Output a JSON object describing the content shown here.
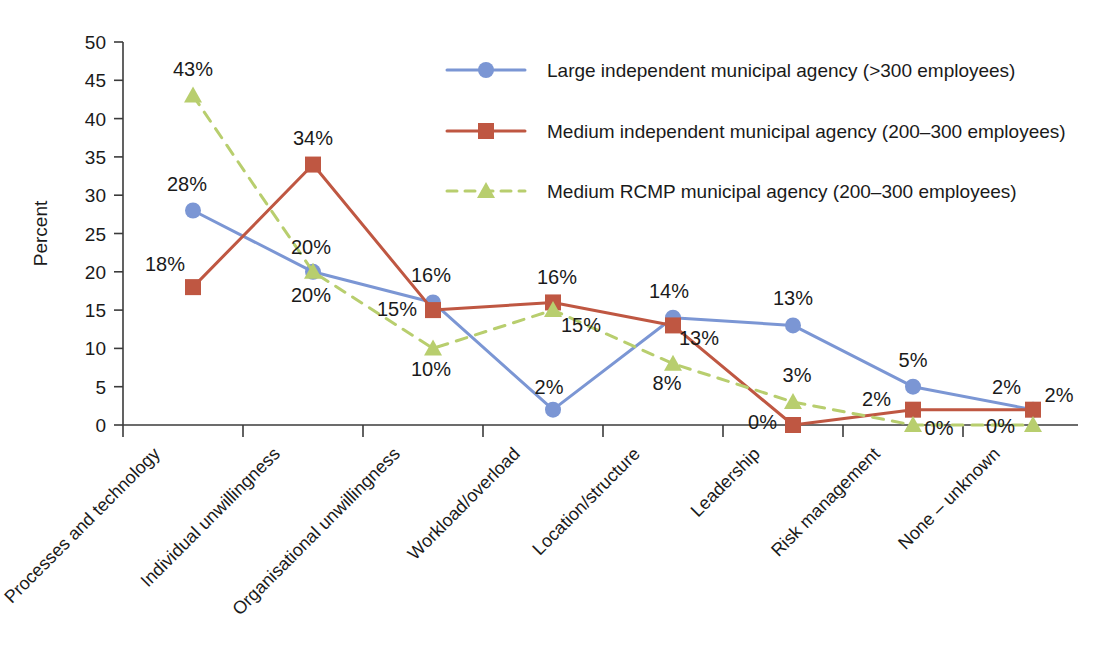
{
  "chart_data": {
    "type": "line",
    "title": "",
    "xlabel": "",
    "ylabel": "Percent",
    "ylim": [
      0,
      50
    ],
    "ytick_step": 5,
    "yticks": [
      "0",
      "5",
      "10",
      "15",
      "20",
      "25",
      "30",
      "35",
      "40",
      "45",
      "50"
    ],
    "grid": false,
    "legend_position": "top-right",
    "value_labels_suffix": "%",
    "categories": [
      "Processes and technology",
      "Individual unwillingness",
      "Organisational unwillingness",
      "Workload/overload",
      "Location/structure",
      "Leadership",
      "Risk management",
      "None – unknown"
    ],
    "series": [
      {
        "name": "Large independent municipal agency (>300 employees)",
        "color": "#7b96d4",
        "marker": "circle",
        "line_style": "solid",
        "values": [
          28,
          20,
          16,
          2,
          14,
          13,
          5,
          2
        ],
        "labels": [
          "28%",
          "20%",
          "16%",
          "2%",
          "14%",
          "13%",
          "5%",
          "2%"
        ]
      },
      {
        "name": "Medium independent municipal agency (200–300 employees)",
        "color": "#bf5742",
        "marker": "square",
        "line_style": "solid",
        "values": [
          18,
          34,
          15,
          16,
          13,
          0,
          2,
          2
        ],
        "labels": [
          "18%",
          "34%",
          "15%",
          "16%",
          "13%",
          "0%",
          "2%",
          "2%"
        ]
      },
      {
        "name": "Medium RCMP municipal agency (200–300 employees)",
        "color": "#b8ce6e",
        "marker": "triangle",
        "line_style": "dashed",
        "values": [
          43,
          20,
          10,
          15,
          8,
          3,
          0,
          0
        ],
        "labels": [
          "43%",
          "20%",
          "10%",
          "15%",
          "8%",
          "3%",
          "0%",
          "0%"
        ]
      }
    ]
  },
  "legend": {
    "entries": [
      "Large independent municipal agency (>300 employees)",
      "Medium independent municipal agency (200–300 employees)",
      "Medium RCMP municipal agency (200–300 employees)"
    ]
  },
  "axes": {
    "y_title": "Percent"
  }
}
